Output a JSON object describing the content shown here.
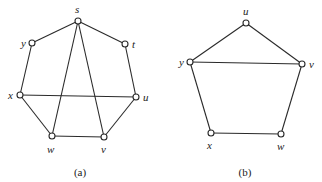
{
  "graphs": [
    {
      "caption": "(a)",
      "nodes": [
        {
          "id": "s",
          "label": "s",
          "x": 78,
          "y": 21,
          "lx": 75,
          "ly": 13
        },
        {
          "id": "y",
          "label": "y",
          "x": 32,
          "y": 43,
          "lx": 21,
          "ly": 47
        },
        {
          "id": "t",
          "label": "t",
          "x": 125,
          "y": 44,
          "lx": 132,
          "ly": 48
        },
        {
          "id": "x",
          "label": "x",
          "x": 20,
          "y": 95,
          "lx": 8,
          "ly": 99
        },
        {
          "id": "u",
          "label": "u",
          "x": 136,
          "y": 97,
          "lx": 143,
          "ly": 101
        },
        {
          "id": "w",
          "label": "w",
          "x": 52,
          "y": 136,
          "lx": 47,
          "ly": 153
        },
        {
          "id": "v",
          "label": "v",
          "x": 104,
          "y": 137,
          "lx": 101,
          "ly": 153
        }
      ],
      "edges": [
        [
          "s",
          "y"
        ],
        [
          "s",
          "t"
        ],
        [
          "y",
          "x"
        ],
        [
          "t",
          "u"
        ],
        [
          "x",
          "u"
        ],
        [
          "x",
          "w"
        ],
        [
          "w",
          "v"
        ],
        [
          "v",
          "u"
        ],
        [
          "s",
          "w"
        ],
        [
          "s",
          "v"
        ]
      ],
      "caption_pos": {
        "x": 80,
        "y": 176
      }
    },
    {
      "caption": "(b)",
      "nodes": [
        {
          "id": "u",
          "label": "u",
          "x": 246,
          "y": 23,
          "lx": 243,
          "ly": 15
        },
        {
          "id": "y",
          "label": "y",
          "x": 190,
          "y": 62,
          "lx": 179,
          "ly": 66
        },
        {
          "id": "v",
          "label": "v",
          "x": 302,
          "y": 64,
          "lx": 309,
          "ly": 68
        },
        {
          "id": "x",
          "label": "x",
          "x": 211,
          "y": 133,
          "lx": 207,
          "ly": 149
        },
        {
          "id": "w",
          "label": "w",
          "x": 281,
          "y": 134,
          "lx": 277,
          "ly": 150
        }
      ],
      "edges": [
        [
          "u",
          "y"
        ],
        [
          "u",
          "v"
        ],
        [
          "y",
          "v"
        ],
        [
          "y",
          "x"
        ],
        [
          "x",
          "w"
        ],
        [
          "w",
          "v"
        ]
      ],
      "caption_pos": {
        "x": 245,
        "y": 176
      }
    }
  ]
}
